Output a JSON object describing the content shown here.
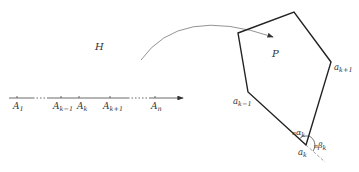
{
  "half_plane": {
    "label": "H"
  },
  "polygon": {
    "label": "P"
  },
  "axis": {
    "ticks": [
      {
        "main": "A",
        "sub": "1"
      },
      {
        "main": "A",
        "sub": "k−1"
      },
      {
        "main": "A",
        "sub": "k"
      },
      {
        "main": "A",
        "sub": "k+1"
      },
      {
        "main": "A",
        "sub": "n"
      }
    ]
  },
  "vertices": {
    "prev": {
      "main": "a",
      "sub": "k−1"
    },
    "next": {
      "main": "a",
      "sub": "k+1"
    },
    "current": {
      "main": "a",
      "sub": "k"
    }
  },
  "angles": {
    "interior": {
      "prefix": "π",
      "main": "α",
      "sub": "k"
    },
    "exterior": {
      "prefix": "π",
      "main": "β",
      "sub": "k"
    }
  },
  "colors": {
    "line": "#222222",
    "arc": "#777777",
    "dash": "#888888"
  }
}
